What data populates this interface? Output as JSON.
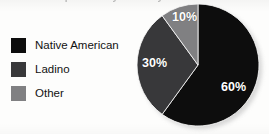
{
  "figure": {
    "title_fragment": "Population by Ethnicity",
    "background_color": "#fdfdfc"
  },
  "legend": {
    "items": [
      {
        "label": "Native American",
        "color": "#0d0d0d",
        "swatch_name": "legend-swatch-native-american"
      },
      {
        "label": "Ladino",
        "color": "#38383a",
        "swatch_name": "legend-swatch-ladino"
      },
      {
        "label": "Other",
        "color": "#808082",
        "swatch_name": "legend-swatch-other"
      }
    ]
  },
  "chart_data": {
    "type": "pie",
    "title": "Population by Ethnicity",
    "xlabel": "",
    "ylabel": "",
    "legend_position": "left",
    "grid": false,
    "start_angle_deg": 0,
    "direction": "clockwise",
    "categories": [
      "Native American",
      "Ladino",
      "Other"
    ],
    "values": [
      60,
      30,
      10
    ],
    "unit": "%",
    "colors": [
      "#0d0d0d",
      "#38383a",
      "#808082"
    ],
    "data_labels": [
      "60%",
      "30%",
      "10%"
    ],
    "slices": [
      {
        "name": "Native American",
        "value": 60,
        "label": "60%",
        "color": "#0d0d0d",
        "start_deg": 0,
        "end_deg": 216
      },
      {
        "name": "Ladino",
        "value": 30,
        "label": "30%",
        "color": "#38383a",
        "start_deg": 216,
        "end_deg": 324
      },
      {
        "name": "Other",
        "value": 10,
        "label": "10%",
        "color": "#808082",
        "start_deg": 324,
        "end_deg": 360
      }
    ]
  }
}
